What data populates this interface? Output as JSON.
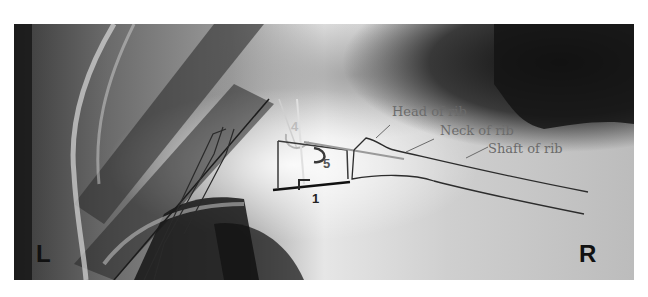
{
  "figure": {
    "type": "annotated radiograph",
    "orientation_labels": {
      "left": "L",
      "right": "R"
    },
    "annotations": [
      {
        "id": "head",
        "text": "Head of rib"
      },
      {
        "id": "neck",
        "text": "Neck of rib"
      },
      {
        "id": "shaft",
        "text": "Shaft of rib"
      }
    ],
    "numbers": {
      "n1": "1",
      "n4": "4",
      "n5": "5"
    },
    "colors": {
      "outline": "#2a2a2a",
      "annotation_text": "#6b6b6b",
      "angle_marker_light": "#bdbdbd",
      "angle_marker_dark": "#3a3a3a",
      "baseline": "#111111"
    }
  }
}
